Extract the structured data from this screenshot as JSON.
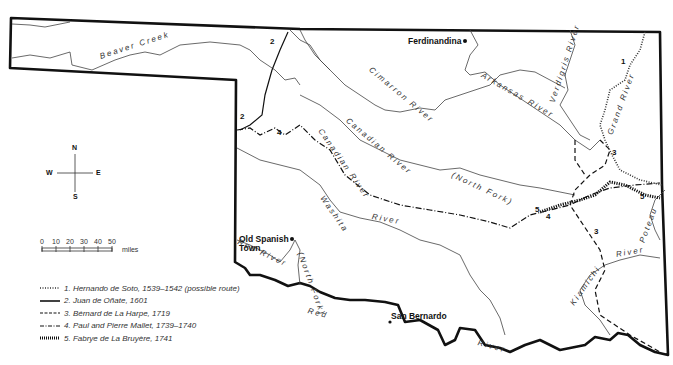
{
  "map": {
    "towns": [
      {
        "name": "Ferdinandina"
      },
      {
        "name": "Old Spanish",
        "name2": "Town"
      },
      {
        "name": "San Bernardo"
      }
    ],
    "rivers": {
      "beaver_creek": "Beaver Creek",
      "cimarron": "Cimarron River",
      "arkansas": "Arkansas River",
      "verdigris": "Verdigris River",
      "grand": "Grand River",
      "canadian": "Canadian River",
      "canadian_north_fork_a": "Canadian River",
      "canadian_north_fork_b": "(North Fork)",
      "washita_a": "Washita",
      "washita_b": "River",
      "red_a": "Red River",
      "red_north_fork": "(North Fork)",
      "red_b": "Red",
      "red_c": "River",
      "kiamichi_a": "Kiamichi",
      "kiamichi_b": "River",
      "poteau": "Poteau"
    },
    "route_numbers": [
      "1",
      "2",
      "3",
      "4",
      "5"
    ]
  },
  "compass": {
    "n": "N",
    "s": "S",
    "e": "E",
    "w": "W"
  },
  "scale": {
    "ticks": [
      "0",
      "10",
      "20",
      "30",
      "40",
      "50"
    ],
    "unit": "miles"
  },
  "legend": {
    "items": [
      {
        "label": "1. Hernando de Soto, 1539–1542 (possible route)",
        "style": "dotted-thin"
      },
      {
        "label": "2. Juan de Oñate, 1601",
        "style": "solid"
      },
      {
        "label": "3. Bérnard de La Harpe, 1719",
        "style": "dashed"
      },
      {
        "label": "4. Paul and Pierre Mallet, 1739–1740",
        "style": "dash-dot"
      },
      {
        "label": "5. Fabrye de La Bruyère, 1741",
        "style": "hatched"
      }
    ]
  },
  "colors": {
    "border": "#111111",
    "river": "#444444",
    "text": "#333333"
  }
}
